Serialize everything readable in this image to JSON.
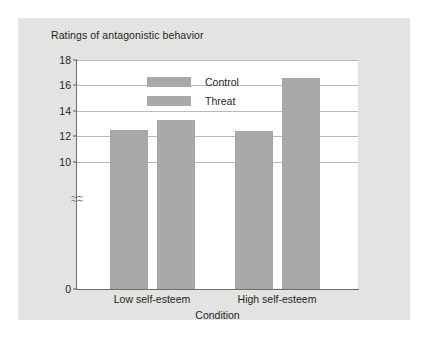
{
  "figure": {
    "title": "Ratings of antagonistic behavior",
    "background_color": "#e3e3e1",
    "plot_background_color": "#ffffff"
  },
  "chart_data": {
    "type": "bar",
    "title": "Ratings of antagonistic behavior",
    "xlabel": "Condition",
    "ylabel": "",
    "categories": [
      "Low self-esteem",
      "High self-esteem"
    ],
    "series": [
      {
        "name": "Control",
        "values": [
          12.5,
          12.4
        ],
        "color": "#a9aaa8"
      },
      {
        "name": "Threat",
        "values": [
          13.25,
          16.55
        ],
        "color": "#a9aaa8"
      }
    ],
    "ylim": [
      0,
      18
    ],
    "yticks": [
      0,
      10,
      12,
      14,
      16,
      18
    ],
    "ytick_labels": [
      "0",
      "10",
      "12",
      "14",
      "16",
      "18"
    ],
    "axis_break": {
      "present": true,
      "between": [
        0,
        10
      ],
      "symbol": "squiggle"
    },
    "grid": {
      "horizontal": true,
      "vertical": false,
      "color": "#b9b9b7"
    },
    "legend": {
      "position": "top-center-inside",
      "entries": [
        "Control",
        "Threat"
      ]
    }
  },
  "legend": {
    "entries": [
      {
        "label": "Control",
        "swatch_color": "#a9aaa8"
      },
      {
        "label": "Threat",
        "swatch_color": "#a9aaa8"
      }
    ]
  },
  "axis": {
    "y_tick_labels": [
      "18",
      "16",
      "14",
      "12",
      "10",
      "0"
    ],
    "x_tick_labels": [
      "Low self-esteem",
      "High self-esteem"
    ],
    "x_axis_title": "Condition"
  }
}
